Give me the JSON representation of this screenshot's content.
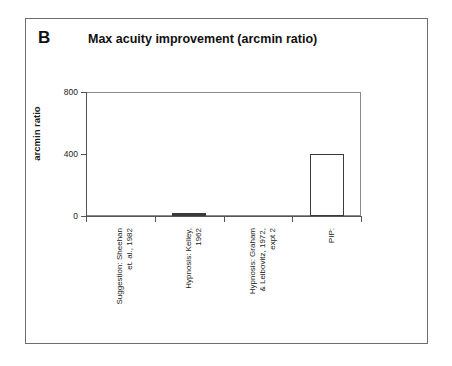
{
  "figure": {
    "panel_label": "B",
    "title": "Max acuity improvement (arcmin ratio)"
  },
  "chart_data": {
    "type": "bar",
    "title": "Max acuity improvement (arcmin ratio)",
    "panel": "B",
    "xlabel": "",
    "ylabel": "arcmin ratio",
    "ylim": [
      0,
      800
    ],
    "yticks": [
      0,
      400,
      800
    ],
    "ytick_labels": [
      "0",
      "400",
      "800"
    ],
    "grid": false,
    "legend": "none",
    "categories": [
      "Suggestion: Sheehan et. al., 1982",
      "Hypnosis: Kelley, 1962",
      "Hypnosis: Graham & Leibovitz, 1972, expt 2",
      "PIP:"
    ],
    "category_lines": [
      [
        "Suggestion: Sheehan",
        "et. al., 1982"
      ],
      [
        "Hypnosis: Kelley,",
        "1962"
      ],
      [
        "Hypnosis: Graham",
        "& Leibovitz, 1972,",
        "expt 2"
      ],
      [
        "PIP:"
      ]
    ],
    "values": [
      0,
      12,
      0,
      400
    ],
    "bar_styles": [
      "none",
      "filled",
      "none",
      "outline"
    ]
  }
}
